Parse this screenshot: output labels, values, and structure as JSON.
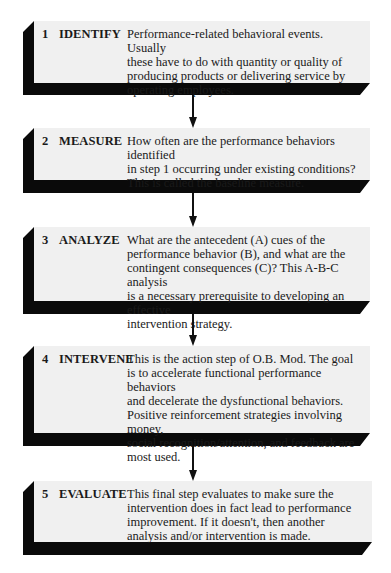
{
  "diagram": {
    "colors": {
      "box_fill": "#f0f0f0",
      "shadow": "#0a0a0a",
      "arrow": "#111111"
    },
    "steps": [
      {
        "number": "1",
        "label": "IDENTIFY",
        "description": "Performance-related behavioral events.  Usually\nthese have to do with quantity or quality of\nproducing products  or delivering service by\noperating  employees."
      },
      {
        "number": "2",
        "label": "MEASURE",
        "description": "How often are the performance behaviors  identified\nin step 1 occurring under existing conditions?\nThis is called the baseline measure."
      },
      {
        "number": "3",
        "label": "ANALYZE",
        "description": "What are the antecedent (A) cues of the\nperformance behavior  (B), and what are the\ncontingent consequences (C)? This A-B-C analysis\nis a necessary prerequisite to developing an effective\nintervention strategy."
      },
      {
        "number": "4",
        "label": "INTERVENE",
        "description": "This is the action step of O.B. Mod. The goal\nis to accelerate functional  performance behaviors\nand decelerate the dysfunctional behaviors.\nPositive reinforcement strategies involving money,\nsocial recognition/attention, and feedback are\nmost used."
      },
      {
        "number": "5",
        "label": "EVALUATE",
        "description": "This final step evaluates  to make sure the\nintervention does in fact lead to performance\nimprovement. If it doesn't,  then another\nanalysis and/or  intervention is made."
      }
    ]
  }
}
